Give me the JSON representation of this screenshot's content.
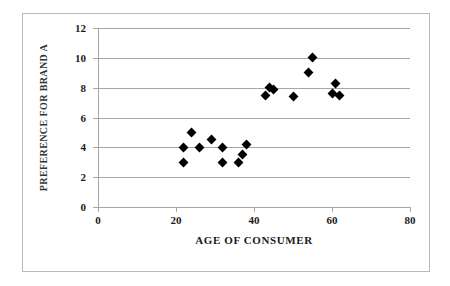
{
  "chart_data": {
    "type": "scatter",
    "title": "",
    "xlabel": "AGE OF CONSUMER",
    "ylabel": "PREFERENCE FOR BRAND A",
    "xlim": [
      0,
      80
    ],
    "ylim": [
      0,
      12
    ],
    "xticks": [
      0,
      20,
      40,
      60,
      80
    ],
    "yticks": [
      0,
      2,
      4,
      6,
      8,
      10,
      12
    ],
    "grid": "horizontal",
    "legend": "none",
    "marker": "filled-diamond",
    "marker_color": "#000000",
    "gridline_color": "#a6a6a6",
    "series": [
      {
        "name": "Consumers",
        "points": [
          {
            "x": 22,
            "y": 4.0
          },
          {
            "x": 22,
            "y": 3.0
          },
          {
            "x": 24,
            "y": 5.0
          },
          {
            "x": 26,
            "y": 4.0
          },
          {
            "x": 29,
            "y": 4.5
          },
          {
            "x": 32,
            "y": 4.0
          },
          {
            "x": 32,
            "y": 3.0
          },
          {
            "x": 36,
            "y": 3.0
          },
          {
            "x": 37,
            "y": 3.5
          },
          {
            "x": 38,
            "y": 4.2
          },
          {
            "x": 43,
            "y": 7.5
          },
          {
            "x": 44,
            "y": 8.0
          },
          {
            "x": 45,
            "y": 7.9
          },
          {
            "x": 50,
            "y": 7.4
          },
          {
            "x": 54,
            "y": 9.0
          },
          {
            "x": 55,
            "y": 10.0
          },
          {
            "x": 61,
            "y": 8.3
          },
          {
            "x": 60,
            "y": 7.6
          },
          {
            "x": 62,
            "y": 7.5
          }
        ]
      }
    ]
  }
}
